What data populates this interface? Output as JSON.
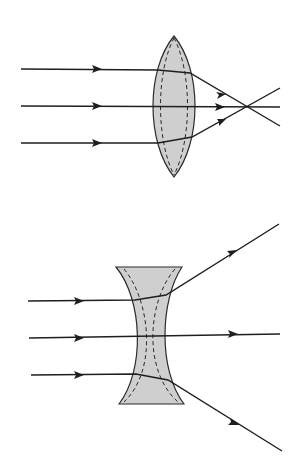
{
  "title": "",
  "colors": {
    "background": "#ffffff",
    "lens_fill": "#cfcfcf",
    "line": "#1e1e1e"
  },
  "diagrams": [
    {
      "id": "converging-lens",
      "description": "Convex (converging) lens: three parallel rays refract and meet at the focal point",
      "lens": {
        "type": "convex",
        "top": [
          174,
          36
        ],
        "bottom": [
          174,
          177
        ],
        "left_x": 152,
        "right_x": 198
      },
      "incoming_rays_y": [
        69,
        106,
        143
      ],
      "focal_point": [
        248,
        107
      ]
    },
    {
      "id": "diverging-lens",
      "description": "Concave (diverging) lens: three parallel rays refract and spread apart",
      "lens": {
        "type": "concave",
        "top_y": 267,
        "bottom_y": 404,
        "waist_y": 336
      },
      "incoming_rays_y": [
        301,
        338,
        375
      ]
    }
  ]
}
